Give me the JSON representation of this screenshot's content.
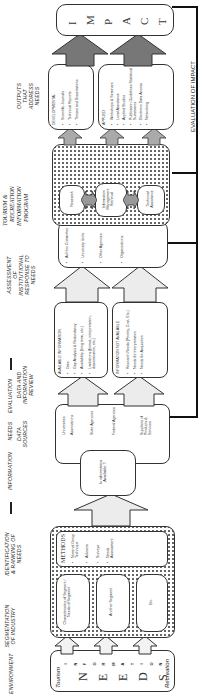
{
  "headers": {
    "environment": "ENVIRONMENT",
    "segmentation": "SEGMENTATION OF INDUSTRY",
    "identification": "IDENTIFICATION & RANKING OF NEEDS",
    "information_needs_evaluation": [
      "INFORMATION",
      "NEEDS",
      "EVALUATION"
    ],
    "data_sources": "DATA SOURCES",
    "data_review": "DATA AND INFORMATION REVIEW",
    "assessment": "ASSESSMENT OF INSTITUTIONAL RESPONSE TO NEEDS",
    "program": [
      "TOURISM &",
      "RECREATION",
      "INFORMATION",
      "PROGRAM"
    ],
    "outputs": "OUTPUTS THAT ADDRESS NEEDS",
    "evaluation_of_impact": "EVALUATION OF IMPACT"
  },
  "environment": {
    "left_label": "Tourism",
    "right_label": "Recreation",
    "vertical_letters": [
      "I",
      "N",
      "F",
      "O",
      "R",
      "M",
      "A",
      "T",
      "I",
      "O",
      "N"
    ],
    "big_letters": [
      "N",
      "E",
      "E",
      "D",
      "S"
    ]
  },
  "segments": [
    {
      "text": "Characteristics of Segment / Needs of Segment"
    },
    {
      "text": "Another Segment"
    },
    {
      "text": "Etc."
    }
  ],
  "methods": {
    "title": "METHODS",
    "items": [
      "Nominal Group Technique",
      "Advisors",
      "Surveys",
      "Needs Assessment"
    ]
  },
  "decision": {
    "text": "Is information Available ?"
  },
  "data_sources": {
    "items": [
      "Universities",
      "Associations",
      "State Agencies",
      "Federal Agencies",
      "Suppliers of Products & Services"
    ]
  },
  "available_info": {
    "title": "AVAILABLE INFORMATION",
    "items": [
      "Data",
      "Gap Analysis & Redundancy",
      "Availability (long term, etc.)",
      "Limitations (format, interpretation, dissemination, etc.)"
    ]
  },
  "not_available_info": {
    "title": "INFORMATION NOT AVAILABLE",
    "items": [
      "Research Needs (Priority, Cost, Etc.)",
      "Needs for Interpretation",
      "Needs for Acquisition"
    ]
  },
  "assessment_items": [
    "Ad Hoc Committee",
    "University Units",
    "Other Agencies",
    "Organizations"
  ],
  "program_boxes": [
    "Research",
    "Information Management Retrieval",
    "Technical Assistance"
  ],
  "developmental": {
    "title": "DEVELOPMENTAL",
    "items": [
      "Scientific Journals",
      "Technical Reports",
      "Theses and Dissertations"
    ]
  },
  "applied": {
    "title": "APPLIED",
    "items": [
      "Workshops & Seminars",
      "Local Assistance",
      "Applied Studies",
      "Publication Guidelines Statistical Summaries",
      "Electronic Data Access",
      "Networking"
    ]
  },
  "impact": {
    "letters": [
      "I",
      "M",
      "P",
      "A",
      "C",
      "T"
    ]
  }
}
